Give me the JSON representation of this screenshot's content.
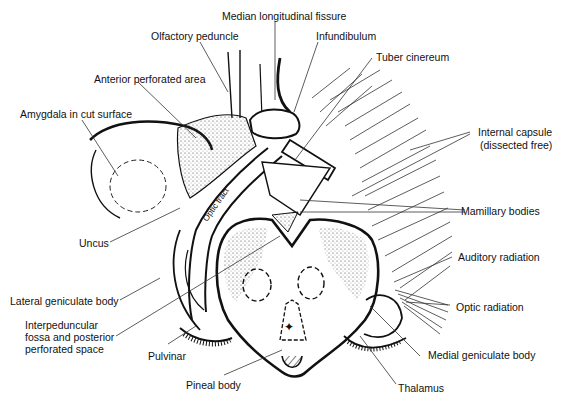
{
  "diagram": {
    "type": "anatomical line drawing",
    "colors": {
      "ink": "#111111",
      "background": "#ffffff",
      "leader": "#333333"
    },
    "labels": {
      "median_longitudinal_fissure": "Median longitudinal fissure",
      "olfactory_peduncle": "Olfactory peduncle",
      "infundibulum": "Infundibulum",
      "tuber_cinereum": "Tuber cinereum",
      "anterior_perforated_area": "Anterior perforated area",
      "amygdala": "Amygdala in cut surface",
      "internal_capsule_line1": "Internal capsule",
      "internal_capsule_line2": "(dissected free)",
      "optic_tract": "Optic tract",
      "mamillary_bodies": "Mamillary bodies",
      "uncus": "Uncus",
      "auditory_radiation": "Auditory radiation",
      "lateral_geniculate_body": "Lateral geniculate body",
      "optic_radiation": "Optic radiation",
      "interpeduncular_line1": "Interpeduncular",
      "interpeduncular_line2": "fossa and posterior",
      "interpeduncular_line3": "perforated space",
      "pulvinar": "Pulvinar",
      "medial_geniculate_body": "Medial geniculate body",
      "pineal_body": "Pineal body",
      "thalamus": "Thalamus"
    }
  }
}
